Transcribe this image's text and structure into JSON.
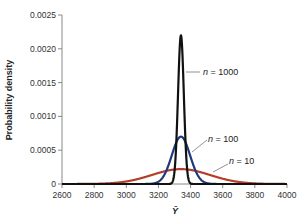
{
  "chart_data": {
    "type": "line",
    "title": "",
    "xlabel": "Ȳ",
    "ylabel": "Probability density",
    "xlim": [
      2600,
      4000
    ],
    "ylim": [
      0,
      0.0025
    ],
    "xticks": [
      2600,
      2800,
      3000,
      3200,
      3400,
      3600,
      3800,
      4000
    ],
    "yticks": [
      0,
      0.0005,
      0.001,
      0.0015,
      0.002,
      0.0025
    ],
    "ytick_labels": [
      "0",
      "0.0005",
      "0.0010",
      "0.0015",
      "0.0020",
      "0.0025"
    ],
    "grid": false,
    "legend_position": "inline annotations",
    "series": [
      {
        "name": "n = 10",
        "distribution": "normal",
        "mean": 3340,
        "sd": 181,
        "peak": 0.00022,
        "color": "#b5402a"
      },
      {
        "name": "n = 100",
        "distribution": "normal",
        "mean": 3340,
        "sd": 57,
        "peak": 0.0007,
        "color": "#1f3a7a"
      },
      {
        "name": "n = 1000",
        "distribution": "normal",
        "mean": 3340,
        "sd": 18,
        "peak": 0.0022,
        "color": "#111111"
      }
    ],
    "annotations": [
      {
        "text_prefix": "n",
        "text_suffix": " = 1000",
        "series": "n = 1000"
      },
      {
        "text_prefix": "n",
        "text_suffix": " = 100",
        "series": "n = 100"
      },
      {
        "text_prefix": "n",
        "text_suffix": " = 10",
        "series": "n = 10"
      }
    ]
  }
}
